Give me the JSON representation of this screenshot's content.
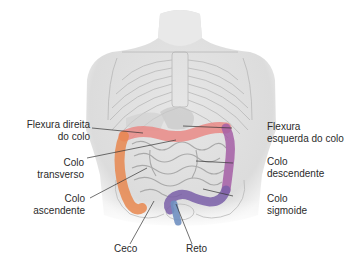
{
  "figure": {
    "type": "anatomical-diagram",
    "colors": {
      "ascending": "#e8874f",
      "transverse": "#e98a86",
      "descending": "#a060a0",
      "sigmoid": "#7a5fa8",
      "rectum": "#6f8fc0",
      "body": "#d9d9d9",
      "bowel": "#bcbcbc"
    }
  },
  "labels": {
    "flexura_direita": {
      "line1": "Flexura direita",
      "line2": "do colo"
    },
    "colo_transverso": {
      "line1": "Colo",
      "line2": "transverso"
    },
    "colo_ascendente": {
      "line1": "Colo",
      "line2": "ascendente"
    },
    "flexura_esquerda": {
      "line1": "Flexura",
      "line2": "esquerda do colo"
    },
    "colo_descendente": {
      "line1": "Colo",
      "line2": "descendente"
    },
    "colo_sigmoide": {
      "line1": "Colo",
      "line2": "sigmoide"
    },
    "ceco": {
      "line1": "Ceco"
    },
    "reto": {
      "line1": "Reto"
    }
  }
}
